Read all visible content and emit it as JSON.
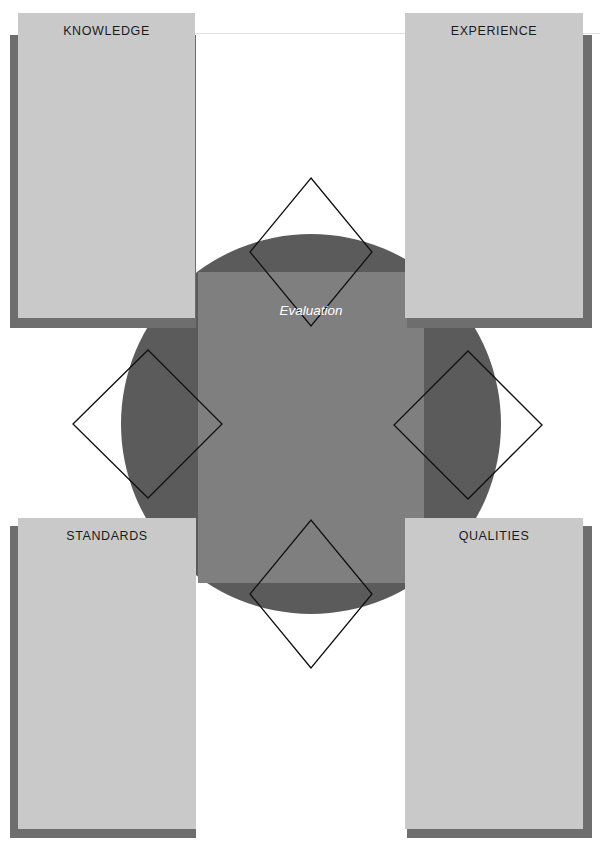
{
  "diagram": {
    "type": "four-quadrant-evaluation-framework",
    "center": {
      "label": "Evaluation",
      "shape": "circle-with-square",
      "circle_color": "#5b5b5b",
      "square_color": "#7f7f7f",
      "label_color": "#ffffff"
    },
    "panels": [
      {
        "id": "knowledge",
        "label": "KNOWLEDGE",
        "position": "top-left",
        "face_color": "#c9c9c9",
        "shadow_color": "#6e6e6e"
      },
      {
        "id": "experience",
        "label": "EXPERIENCE",
        "position": "top-right",
        "face_color": "#c9c9c9",
        "shadow_color": "#6e6e6e"
      },
      {
        "id": "standards",
        "label": "STANDARDS",
        "position": "bottom-left",
        "face_color": "#c9c9c9",
        "shadow_color": "#6e6e6e"
      },
      {
        "id": "qualities",
        "label": "QUALITIES",
        "position": "bottom-right",
        "face_color": "#c9c9c9",
        "shadow_color": "#6e6e6e"
      }
    ],
    "connectors": [
      {
        "id": "connector-top",
        "shape": "diamond-outline",
        "stroke": "#111111"
      },
      {
        "id": "connector-left",
        "shape": "diamond-outline",
        "stroke": "#111111"
      },
      {
        "id": "connector-right",
        "shape": "diamond-outline",
        "stroke": "#111111"
      },
      {
        "id": "connector-bottom",
        "shape": "diamond-outline",
        "stroke": "#111111"
      }
    ],
    "background_color": "#ffffff"
  }
}
